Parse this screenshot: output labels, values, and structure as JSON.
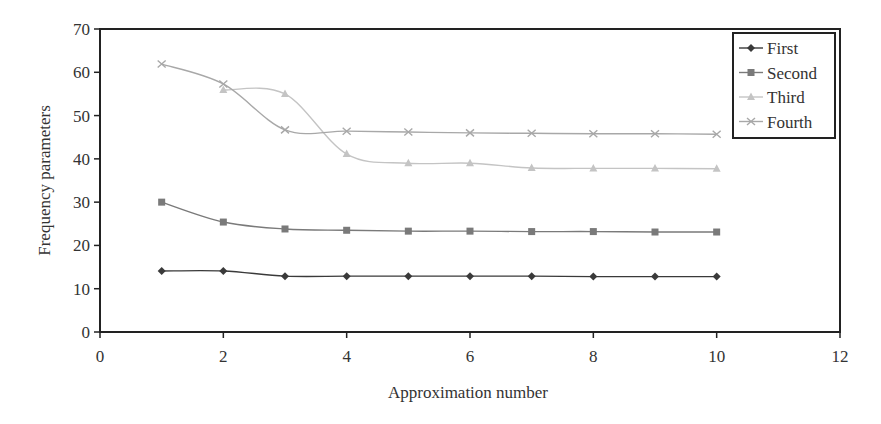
{
  "chart_data": {
    "type": "line",
    "title": "",
    "xlabel": "Approximation number",
    "ylabel": "Frequency parameters",
    "xlim": [
      0,
      12
    ],
    "ylim": [
      0,
      70
    ],
    "xticks": [
      0,
      2,
      4,
      6,
      8,
      10,
      12
    ],
    "yticks": [
      0,
      10,
      20,
      30,
      40,
      50,
      60,
      70
    ],
    "grid": false,
    "legend_position": "upper right",
    "x": [
      1,
      2,
      3,
      4,
      5,
      6,
      7,
      8,
      9,
      10
    ],
    "series": [
      {
        "name": "First",
        "marker": "diamond",
        "color": "#3a3a3a",
        "values": [
          14.1,
          14.1,
          12.9,
          12.9,
          12.9,
          12.9,
          12.9,
          12.8,
          12.8,
          12.8
        ]
      },
      {
        "name": "Second",
        "marker": "square",
        "color": "#7a7a7a",
        "values": [
          30.0,
          25.4,
          23.8,
          23.5,
          23.3,
          23.3,
          23.2,
          23.2,
          23.1,
          23.1
        ]
      },
      {
        "name": "Third",
        "marker": "triangle",
        "color": "#c4c4c4",
        "values": [
          null,
          55.9,
          55.0,
          41.1,
          39.0,
          39.0,
          37.9,
          37.8,
          37.8,
          37.7
        ]
      },
      {
        "name": "Fourth",
        "marker": "x",
        "color": "#a8a8a8",
        "values": [
          61.9,
          57.3,
          46.7,
          46.4,
          46.2,
          46.0,
          45.9,
          45.8,
          45.8,
          45.7
        ]
      }
    ]
  }
}
